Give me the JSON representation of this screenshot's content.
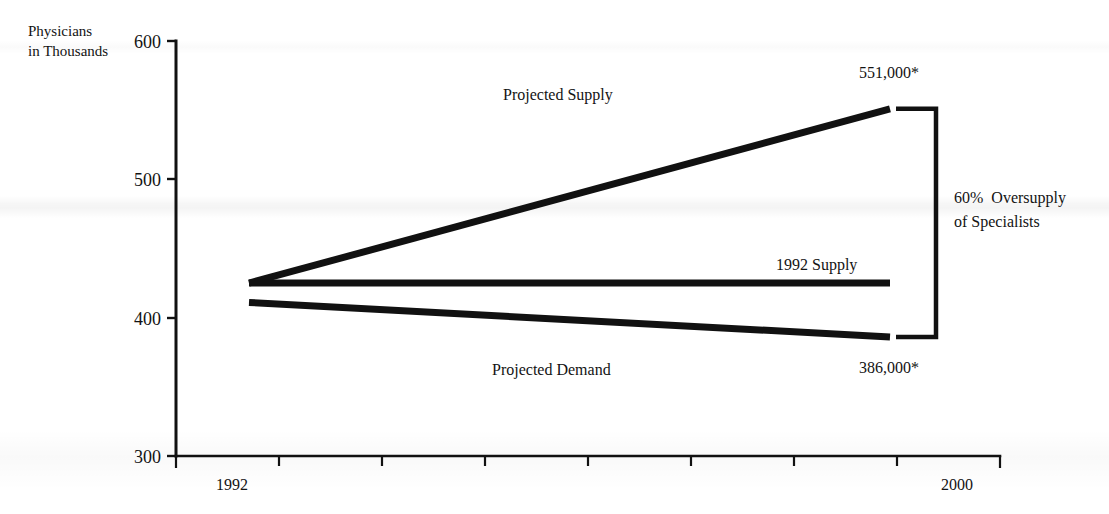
{
  "chart_data": {
    "type": "line",
    "title": "",
    "subtitle": "",
    "ylabel_line1": "Physicians",
    "ylabel_line2": "in Thousands",
    "xlabel": "",
    "ylim": [
      300,
      600
    ],
    "yticks": [
      300,
      400,
      500,
      600
    ],
    "ytick_labels": [
      "300",
      "400",
      "500",
      "600"
    ],
    "xlim": [
      1992,
      2000
    ],
    "xticks": [
      1992,
      1993,
      1994,
      1995,
      1996,
      1997,
      1998,
      1999,
      2000
    ],
    "xtick_labels_shown": [
      "1992",
      "2000"
    ],
    "grid": false,
    "legend_position": "inline-annotations",
    "x": [
      1992,
      2000
    ],
    "series": [
      {
        "name": "Projected Supply",
        "values": [
          425,
          551
        ],
        "label": "Projected Supply",
        "end_value_label": "551,000*"
      },
      {
        "name": "1992 Supply",
        "values": [
          425,
          425
        ],
        "label": "1992 Supply",
        "end_value_label": ""
      },
      {
        "name": "Projected Demand",
        "values": [
          411,
          386
        ],
        "label": "Projected Demand",
        "end_value_label": "386,000*"
      }
    ],
    "annotations": [
      {
        "name": "oversupply-bracket",
        "text_line1": "60%  Oversupply",
        "text_line2": "of Specialists",
        "spans_from": 386,
        "spans_to": 551
      }
    ],
    "footnote_marker": "*",
    "line_color": "#111111"
  },
  "axis": {
    "y_title_line1": "Physicians",
    "y_title_line2": "in Thousands",
    "ytick_600": "600",
    "ytick_500": "500",
    "ytick_400": "400",
    "ytick_300": "300",
    "xtick_1992": "1992",
    "xtick_2000": "2000"
  },
  "labels": {
    "projected_supply": "Projected Supply",
    "supply_1992": "1992 Supply",
    "projected_demand": "Projected Demand",
    "value_top": "551,000*",
    "value_bottom": "386,000*",
    "bracket_line1": "60%  Oversupply",
    "bracket_line2": "of Specialists"
  },
  "colors": {
    "ink": "#111111",
    "background": "#ffffff"
  }
}
